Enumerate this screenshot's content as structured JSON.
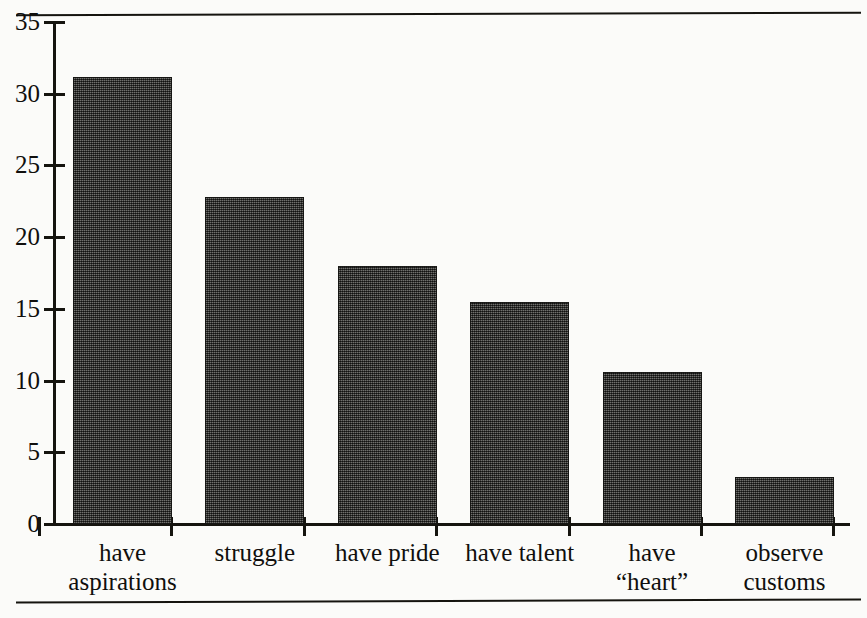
{
  "figure": {
    "kind": "printed-bar-chart",
    "ink_color": "#15140f",
    "bar_fill": "#4a4a46",
    "paper_color": "#fbfbf9"
  },
  "chart_data": {
    "type": "bar",
    "title": "",
    "subtitle": "",
    "xlabel": "",
    "ylabel": "",
    "categories": [
      "have\naspirations",
      "struggle",
      "have pride",
      "have talent",
      "have\n“heart”",
      "observe\ncustoms"
    ],
    "values": [
      31.2,
      22.8,
      18.0,
      15.5,
      10.6,
      3.3
    ],
    "ylim": [
      0,
      35
    ],
    "ytick_values": [
      0,
      5,
      10,
      15,
      20,
      25,
      30,
      35
    ],
    "ytick_labels": [
      "0",
      "5",
      "10",
      "15",
      "20",
      "25",
      "30",
      "35"
    ],
    "grid": false,
    "legend": null,
    "annotations": []
  }
}
